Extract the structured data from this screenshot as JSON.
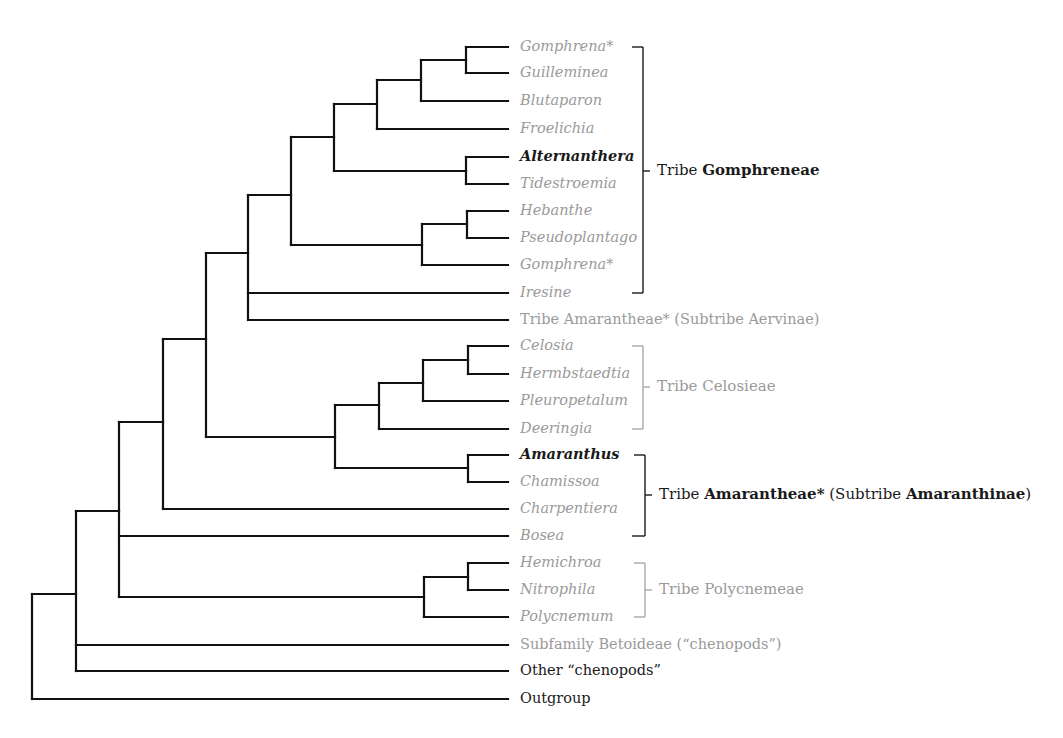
{
  "diagram": {
    "type": "phylogenetic-tree",
    "colors": {
      "branch": "#111111",
      "text_dark": "#1a1a1a",
      "text_grey": "#9a9a9a"
    },
    "leaves": [
      {
        "id": "gomphrena1",
        "label": "Gomphrena*",
        "y": 47,
        "italic": true,
        "emph": false
      },
      {
        "id": "guilleminea",
        "label": "Guilleminea",
        "y": 73,
        "italic": true,
        "emph": false
      },
      {
        "id": "blutaparon",
        "label": "Blutaparon",
        "y": 101,
        "italic": true,
        "emph": false
      },
      {
        "id": "froelichia",
        "label": "Froelichia",
        "y": 129,
        "italic": true,
        "emph": false
      },
      {
        "id": "alternanthera",
        "label": "Alternanthera",
        "y": 157,
        "italic": true,
        "emph": true
      },
      {
        "id": "tidestroemia",
        "label": "Tidestroemia",
        "y": 184,
        "italic": true,
        "emph": false
      },
      {
        "id": "hebanthe",
        "label": "Hebanthe",
        "y": 211,
        "italic": true,
        "emph": false
      },
      {
        "id": "pseudoplantago",
        "label": "Pseudoplantago",
        "y": 238,
        "italic": true,
        "emph": false
      },
      {
        "id": "gomphrena2",
        "label": "Gomphrena*",
        "y": 265,
        "italic": true,
        "emph": false
      },
      {
        "id": "iresine",
        "label": "Iresine",
        "y": 293,
        "italic": true,
        "emph": false
      },
      {
        "id": "aervinae",
        "label": "Tribe Amarantheae* (Subtribe Aervinae)",
        "y": 320,
        "italic": false,
        "emph": false
      },
      {
        "id": "celosia",
        "label": "Celosia",
        "y": 346,
        "italic": true,
        "emph": false
      },
      {
        "id": "hermbstaedtia",
        "label": "Hermbstaedtia",
        "y": 374,
        "italic": true,
        "emph": false
      },
      {
        "id": "pleuropetalum",
        "label": "Pleuropetalum",
        "y": 401,
        "italic": true,
        "emph": false
      },
      {
        "id": "deeringia",
        "label": "Deeringia",
        "y": 429,
        "italic": true,
        "emph": false
      },
      {
        "id": "amaranthus",
        "label": "Amaranthus",
        "y": 455,
        "italic": true,
        "emph": true
      },
      {
        "id": "chamissoa",
        "label": "Chamissoa",
        "y": 482,
        "italic": true,
        "emph": false
      },
      {
        "id": "charpentiera",
        "label": "Charpentiera",
        "y": 509,
        "italic": true,
        "emph": false
      },
      {
        "id": "bosea",
        "label": "Bosea",
        "y": 536,
        "italic": true,
        "emph": false
      },
      {
        "id": "hemichroa",
        "label": "Hemichroa",
        "y": 563,
        "italic": true,
        "emph": false
      },
      {
        "id": "nitrophila",
        "label": "Nitrophila",
        "y": 590,
        "italic": true,
        "emph": false
      },
      {
        "id": "polycnemum",
        "label": "Polycnemum",
        "y": 617,
        "italic": true,
        "emph": false
      },
      {
        "id": "betoideae",
        "label": "Subfamily Betoideae (“chenopods”)",
        "y": 645,
        "italic": false,
        "emph": false
      },
      {
        "id": "other-chenopods",
        "label": "Other “chenopods”",
        "y": 671,
        "italic": false,
        "emph": false,
        "dark": true
      },
      {
        "id": "outgroup",
        "label": "Outgroup",
        "y": 699,
        "italic": false,
        "emph": false,
        "dark": true
      }
    ],
    "nodes": [
      {
        "x": 466,
        "y1": 47,
        "y2": 73,
        "ymid": 60,
        "parent_x": 421
      },
      {
        "x": 421,
        "y1": 60,
        "y2": 101,
        "ymid": 80,
        "parent_x": 377
      },
      {
        "x": 377,
        "y1": 80,
        "y2": 129,
        "ymid": 104,
        "parent_x": 334
      },
      {
        "x": 466,
        "y1": 157,
        "y2": 184,
        "ymid": 171,
        "parent_x": 334
      },
      {
        "x": 334,
        "y1": 104,
        "y2": 171,
        "ymid": 137,
        "parent_x": 291
      },
      {
        "x": 467,
        "y1": 211,
        "y2": 238,
        "ymid": 224,
        "parent_x": 422
      },
      {
        "x": 422,
        "y1": 224,
        "y2": 265,
        "ymid": 245,
        "parent_x": 291
      },
      {
        "x": 291,
        "y1": 137,
        "y2": 245,
        "ymid": 195,
        "parent_x": 248
      },
      {
        "x": 248,
        "y1": 195,
        "y2": 320,
        "ymid": 253,
        "parent_x": 206
      },
      {
        "x": 468,
        "y1": 346,
        "y2": 374,
        "ymid": 360,
        "parent_x": 423
      },
      {
        "x": 423,
        "y1": 360,
        "y2": 401,
        "ymid": 383,
        "parent_x": 379
      },
      {
        "x": 379,
        "y1": 383,
        "y2": 429,
        "ymid": 405,
        "parent_x": 335
      },
      {
        "x": 468,
        "y1": 455,
        "y2": 482,
        "ymid": 468,
        "parent_x": 335
      },
      {
        "x": 335,
        "y1": 405,
        "y2": 468,
        "ymid": 437,
        "parent_x": 206
      },
      {
        "x": 206,
        "y1": 253,
        "y2": 437,
        "ymid": 339,
        "parent_x": 163
      },
      {
        "x": 163,
        "y1": 339,
        "y2": 509,
        "ymid": 422,
        "parent_x": 119
      },
      {
        "x": 468,
        "y1": 563,
        "y2": 590,
        "ymid": 577,
        "parent_x": 424
      },
      {
        "x": 424,
        "y1": 577,
        "y2": 617,
        "ymid": 597,
        "parent_x": 119
      },
      {
        "x": 119,
        "y1": 422,
        "y2": 597,
        "ymid": 511,
        "parent_x": 76
      },
      {
        "x": 76,
        "y1": 511,
        "y2": 671,
        "ymid": 594,
        "parent_x": 32
      },
      {
        "x": 32,
        "y1": 594,
        "y2": 699,
        "ymid": 646,
        "parent_x": null
      }
    ],
    "leaf_edges": [
      {
        "from_x": 466,
        "y": 47
      },
      {
        "from_x": 466,
        "y": 73
      },
      {
        "from_x": 421,
        "y": 101
      },
      {
        "from_x": 377,
        "y": 129
      },
      {
        "from_x": 466,
        "y": 157
      },
      {
        "from_x": 466,
        "y": 184
      },
      {
        "from_x": 467,
        "y": 211
      },
      {
        "from_x": 467,
        "y": 238
      },
      {
        "from_x": 422,
        "y": 265
      },
      {
        "from_x": 248,
        "y": 293
      },
      {
        "from_x": 248,
        "y": 320
      },
      {
        "from_x": 468,
        "y": 346
      },
      {
        "from_x": 468,
        "y": 374
      },
      {
        "from_x": 423,
        "y": 401
      },
      {
        "from_x": 379,
        "y": 429
      },
      {
        "from_x": 468,
        "y": 455
      },
      {
        "from_x": 468,
        "y": 482
      },
      {
        "from_x": 163,
        "y": 509
      },
      {
        "from_x": 119,
        "y": 536
      },
      {
        "from_x": 468,
        "y": 563
      },
      {
        "from_x": 468,
        "y": 590
      },
      {
        "from_x": 424,
        "y": 617
      },
      {
        "from_x": 76,
        "y": 645
      },
      {
        "from_x": 76,
        "y": 671
      },
      {
        "from_x": 32,
        "y": 699
      }
    ],
    "leaf_end_x": 508,
    "label_x": 520,
    "groups": [
      {
        "id": "gomphreneae",
        "prefix": "Tribe ",
        "name": "Gomphreneae",
        "suffix": "",
        "suffix_bold": "",
        "end": "",
        "bracket_x": 643,
        "y1": 47,
        "y2": 293,
        "top_tick_from": 632,
        "bottom_tick_from": 632,
        "label_y": 171,
        "color": "dark"
      },
      {
        "id": "celosieae",
        "prefix": "Tribe Celosieae",
        "name": "",
        "suffix": "",
        "suffix_bold": "",
        "end": "",
        "bracket_x": 643,
        "y1": 346,
        "y2": 429,
        "top_tick_from": 632,
        "bottom_tick_from": 632,
        "label_y": 387,
        "color": "grey"
      },
      {
        "id": "amaranthinae",
        "prefix": "Tribe ",
        "name": "Amarantheae*",
        "suffix": " (Subtribe ",
        "suffix_bold": "Amaranthinae",
        "end": ")",
        "bracket_x": 645,
        "y1": 455,
        "y2": 536,
        "top_tick_from": 634,
        "bottom_tick_from": 632,
        "label_y": 495,
        "color": "dark"
      },
      {
        "id": "polycnemeae",
        "prefix": "Tribe Polycnemeae",
        "name": "",
        "suffix": "",
        "suffix_bold": "",
        "end": "",
        "bracket_x": 645,
        "y1": 563,
        "y2": 617,
        "top_tick_from": 634,
        "bottom_tick_from": 634,
        "label_y": 590,
        "color": "grey"
      }
    ]
  }
}
